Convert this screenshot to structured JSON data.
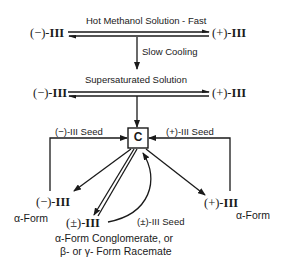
{
  "diagram": {
    "top_row": {
      "label": "Hot Methanol Solution - Fast",
      "left_compound": {
        "prefix": "(−)-",
        "numeral": "III"
      },
      "right_compound": {
        "prefix": "(+)-",
        "numeral": "III"
      }
    },
    "cooling_step": {
      "label": "Slow Cooling"
    },
    "middle_row": {
      "label": "Supersaturated Solution",
      "left_compound": {
        "prefix": "(−)-",
        "numeral": "III"
      },
      "right_compound": {
        "prefix": "(+)-",
        "numeral": "III"
      }
    },
    "center_node": {
      "label": "C"
    },
    "left_seed": {
      "label": "(−)-III Seed"
    },
    "right_seed": {
      "label": "(+)-III Seed"
    },
    "racemic_seed": {
      "label": "(±)-III Seed"
    },
    "left_product": {
      "prefix": "(−)-",
      "numeral": "III",
      "form": "α-Form"
    },
    "right_product": {
      "prefix": "(+)-",
      "numeral": "III",
      "form": "α-Form"
    },
    "racemic_product": {
      "prefix": "(±)-",
      "numeral": "III",
      "line1": "α-Form Conglomerate, or",
      "line2": "β- or γ- Form Racemate"
    }
  }
}
